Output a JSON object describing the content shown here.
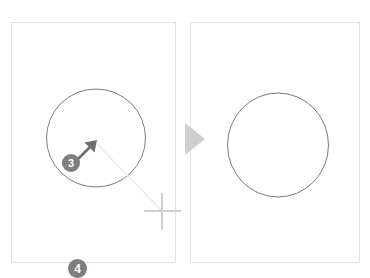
{
  "figure": {
    "background_color": "#ffffff"
  },
  "colors": {
    "panel_border": "#e2e2e2",
    "shape_stroke": "#6b6b6b",
    "badge_fill": "#7e7e7e",
    "badge_text": "#ffffff",
    "cursor_fill": "#6e6e6e",
    "crosshair": "#cfcfcf",
    "drag_line": "#e8e8e8",
    "transition_arrow": "#cfcfcf"
  },
  "panels": [
    {
      "id": "before",
      "name": "before-panel",
      "label": "",
      "shape": {
        "type": "circle",
        "cx": 95,
        "cy": 137,
        "r": 49
      }
    },
    {
      "id": "after",
      "name": "after-panel",
      "label": "",
      "shape": {
        "type": "circle",
        "cx": 277,
        "cy": 144,
        "r": 51
      }
    }
  ],
  "annotations": {
    "cursor": {
      "icon": "arrow-cursor-icon",
      "direction": "up-right",
      "tip_x": 96,
      "tip_y": 143
    },
    "drag_line": {
      "from_x": 96,
      "from_y": 143,
      "to_x": 162,
      "to_y": 211
    },
    "crosshair": {
      "icon": "crosshair-icon",
      "cx": 162,
      "cy": 211
    },
    "transition": {
      "icon": "triangle-right-icon"
    }
  },
  "steps": [
    {
      "id": "step-3",
      "label": "3"
    },
    {
      "id": "step-4",
      "label": "4"
    }
  ]
}
